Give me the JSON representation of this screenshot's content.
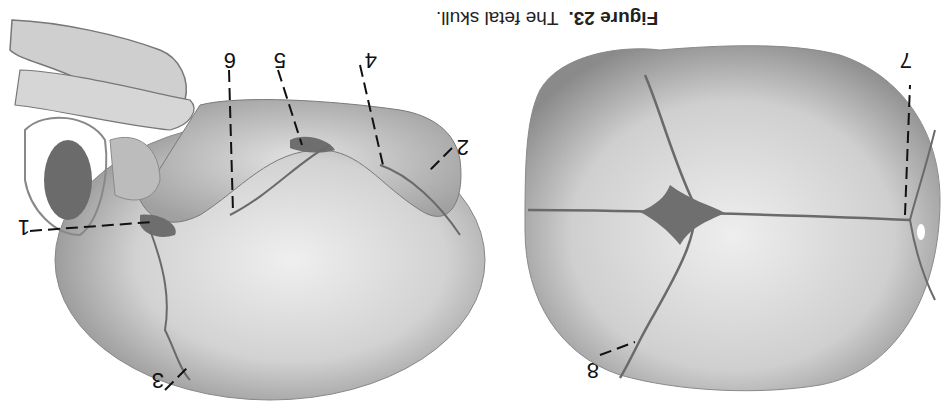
{
  "figure": {
    "number_label": "Figure 23.",
    "title": "The fetal skull.",
    "orientation": "rotated 180 degrees",
    "left_view": {
      "description": "lateral view of fetal skull",
      "labels": [
        "1",
        "2",
        "3",
        "4",
        "5",
        "6"
      ]
    },
    "right_view": {
      "description": "superior view of fetal skull",
      "labels": [
        "7",
        "8"
      ]
    }
  },
  "colors": {
    "background": "#ffffff",
    "bone_light": "#e6e6e6",
    "bone_mid": "#bdbdbd",
    "bone_dark": "#7a7a7a",
    "label": "#111111"
  }
}
